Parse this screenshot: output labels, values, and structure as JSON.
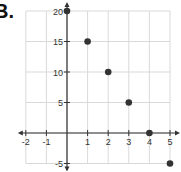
{
  "problem_label": "B.",
  "chart_data": {
    "type": "scatter",
    "title": "",
    "xlabel": "",
    "ylabel": "",
    "x": [
      0,
      1,
      2,
      3,
      4,
      5
    ],
    "y": [
      20,
      15,
      10,
      5,
      0,
      -5
    ],
    "points": [
      {
        "x": 0,
        "y": 20
      },
      {
        "x": 1,
        "y": 15
      },
      {
        "x": 2,
        "y": 10
      },
      {
        "x": 3,
        "y": 5
      },
      {
        "x": 4,
        "y": 0
      },
      {
        "x": 5,
        "y": -5
      }
    ],
    "xlim": [
      -2,
      5
    ],
    "ylim": [
      -5,
      20
    ],
    "x_ticks": [
      -2,
      -1,
      1,
      2,
      3,
      4,
      5
    ],
    "y_ticks": [
      -5,
      5,
      10,
      15,
      20
    ],
    "x_grid_step": 1,
    "y_grid_step": 5,
    "grid": true,
    "legend": null,
    "colors": {
      "point": "#333333",
      "axis": "#333333",
      "grid": "#d9d9d9"
    }
  }
}
